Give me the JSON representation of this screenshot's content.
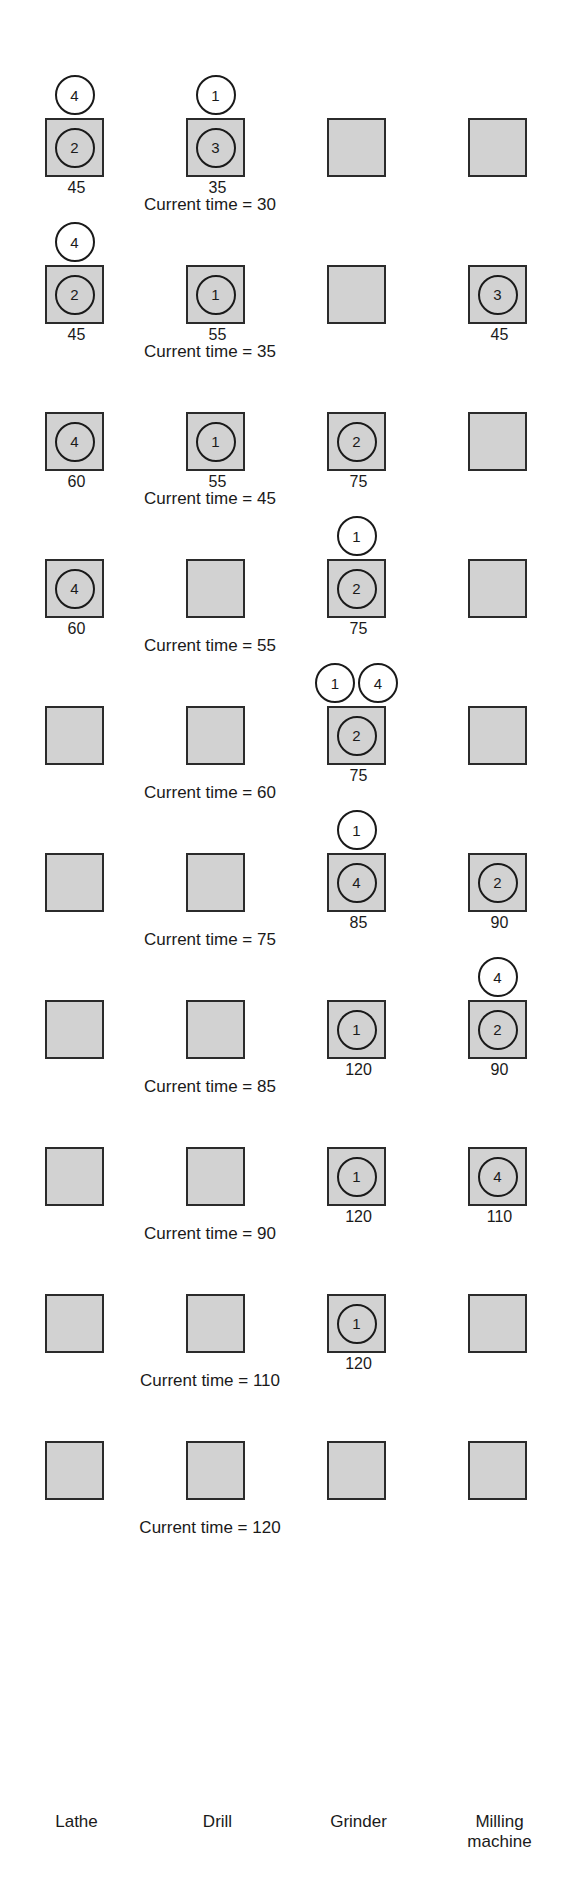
{
  "figure": {
    "kind": "job-shop-scheduling-simulation-timeline",
    "columns": [
      "Lathe",
      "Drill",
      "Grinder",
      "Milling\nmachine"
    ],
    "time_caption_prefix": "Current time = ",
    "snapshots": [
      {
        "time": "30",
        "caption": "Current time = 30",
        "cells": [
          {
            "machine": "Lathe",
            "job_in_machine": "2",
            "finish_time": "45",
            "queue": [
              "4"
            ]
          },
          {
            "machine": "Drill",
            "job_in_machine": "3",
            "finish_time": "35",
            "queue": [
              "1"
            ]
          },
          {
            "machine": "Grinder",
            "job_in_machine": "",
            "finish_time": "",
            "queue": []
          },
          {
            "machine": "Milling machine",
            "job_in_machine": "",
            "finish_time": "",
            "queue": []
          }
        ]
      },
      {
        "time": "35",
        "caption": "Current time = 35",
        "cells": [
          {
            "machine": "Lathe",
            "job_in_machine": "2",
            "finish_time": "45",
            "queue": [
              "4"
            ]
          },
          {
            "machine": "Drill",
            "job_in_machine": "1",
            "finish_time": "55",
            "queue": []
          },
          {
            "machine": "Grinder",
            "job_in_machine": "",
            "finish_time": "",
            "queue": []
          },
          {
            "machine": "Milling machine",
            "job_in_machine": "3",
            "finish_time": "45",
            "queue": []
          }
        ]
      },
      {
        "time": "45",
        "caption": "Current time = 45",
        "cells": [
          {
            "machine": "Lathe",
            "job_in_machine": "4",
            "finish_time": "60",
            "queue": []
          },
          {
            "machine": "Drill",
            "job_in_machine": "1",
            "finish_time": "55",
            "queue": []
          },
          {
            "machine": "Grinder",
            "job_in_machine": "2",
            "finish_time": "75",
            "queue": []
          },
          {
            "machine": "Milling machine",
            "job_in_machine": "",
            "finish_time": "",
            "queue": []
          }
        ]
      },
      {
        "time": "55",
        "caption": "Current time = 55",
        "cells": [
          {
            "machine": "Lathe",
            "job_in_machine": "4",
            "finish_time": "60",
            "queue": []
          },
          {
            "machine": "Drill",
            "job_in_machine": "",
            "finish_time": "",
            "queue": []
          },
          {
            "machine": "Grinder",
            "job_in_machine": "2",
            "finish_time": "75",
            "queue": [
              "1"
            ]
          },
          {
            "machine": "Milling machine",
            "job_in_machine": "",
            "finish_time": "",
            "queue": []
          }
        ]
      },
      {
        "time": "60",
        "caption": "Current time = 60",
        "cells": [
          {
            "machine": "Lathe",
            "job_in_machine": "",
            "finish_time": "",
            "queue": []
          },
          {
            "machine": "Drill",
            "job_in_machine": "",
            "finish_time": "",
            "queue": []
          },
          {
            "machine": "Grinder",
            "job_in_machine": "2",
            "finish_time": "75",
            "queue": [
              "1",
              "4"
            ]
          },
          {
            "machine": "Milling machine",
            "job_in_machine": "",
            "finish_time": "",
            "queue": []
          }
        ]
      },
      {
        "time": "75",
        "caption": "Current time = 75",
        "cells": [
          {
            "machine": "Lathe",
            "job_in_machine": "",
            "finish_time": "",
            "queue": []
          },
          {
            "machine": "Drill",
            "job_in_machine": "",
            "finish_time": "",
            "queue": []
          },
          {
            "machine": "Grinder",
            "job_in_machine": "4",
            "finish_time": "85",
            "queue": [
              "1"
            ]
          },
          {
            "machine": "Milling machine",
            "job_in_machine": "2",
            "finish_time": "90",
            "queue": []
          }
        ]
      },
      {
        "time": "85",
        "caption": "Current time = 85",
        "cells": [
          {
            "machine": "Lathe",
            "job_in_machine": "",
            "finish_time": "",
            "queue": []
          },
          {
            "machine": "Drill",
            "job_in_machine": "",
            "finish_time": "",
            "queue": []
          },
          {
            "machine": "Grinder",
            "job_in_machine": "1",
            "finish_time": "120",
            "queue": []
          },
          {
            "machine": "Milling machine",
            "job_in_machine": "2",
            "finish_time": "90",
            "queue": [
              "4"
            ]
          }
        ]
      },
      {
        "time": "90",
        "caption": "Current time = 90",
        "cells": [
          {
            "machine": "Lathe",
            "job_in_machine": "",
            "finish_time": "",
            "queue": []
          },
          {
            "machine": "Drill",
            "job_in_machine": "",
            "finish_time": "",
            "queue": []
          },
          {
            "machine": "Grinder",
            "job_in_machine": "1",
            "finish_time": "120",
            "queue": []
          },
          {
            "machine": "Milling machine",
            "job_in_machine": "4",
            "finish_time": "110",
            "queue": []
          }
        ]
      },
      {
        "time": "110",
        "caption": "Current time = 110",
        "cells": [
          {
            "machine": "Lathe",
            "job_in_machine": "",
            "finish_time": "",
            "queue": []
          },
          {
            "machine": "Drill",
            "job_in_machine": "",
            "finish_time": "",
            "queue": []
          },
          {
            "machine": "Grinder",
            "job_in_machine": "1",
            "finish_time": "120",
            "queue": []
          },
          {
            "machine": "Milling machine",
            "job_in_machine": "",
            "finish_time": "",
            "queue": []
          }
        ]
      },
      {
        "time": "120",
        "caption": "Current time = 120",
        "cells": [
          {
            "machine": "Lathe",
            "job_in_machine": "",
            "finish_time": "",
            "queue": []
          },
          {
            "machine": "Drill",
            "job_in_machine": "",
            "finish_time": "",
            "queue": []
          },
          {
            "machine": "Grinder",
            "job_in_machine": "",
            "finish_time": "",
            "queue": []
          },
          {
            "machine": "Milling machine",
            "job_in_machine": "",
            "finish_time": "",
            "queue": []
          }
        ]
      }
    ],
    "colors": {
      "machine_fill": "#d2d2d2",
      "machine_border": "#2b2b2b",
      "token_fill": "#ffffff",
      "token_border": "#1a1a1a",
      "text": "#1a1a1a",
      "background": "#ffffff"
    },
    "layout": {
      "snapshot_tops": [
        88,
        188,
        288,
        388,
        488,
        588,
        688,
        788,
        888,
        988
      ],
      "caption_tops": [
        218,
        318,
        418,
        518,
        618,
        718,
        818,
        918,
        1018,
        1118
      ],
      "caption_left": 60
    }
  }
}
